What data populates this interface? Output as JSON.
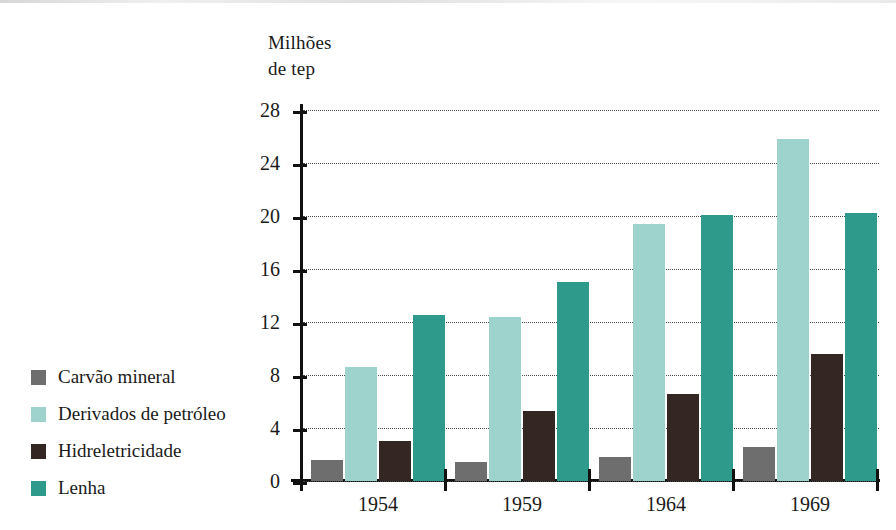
{
  "chart_data": {
    "type": "bar",
    "title": "",
    "axis_title": "Milhões\nde tep",
    "ylabel": "Milhões de tep",
    "xlabel": "",
    "categories": [
      "1954",
      "1959",
      "1964",
      "1969"
    ],
    "series": [
      {
        "name": "Carvão mineral",
        "color": "#6e6e6e",
        "values": [
          1.6,
          1.4,
          1.8,
          2.6
        ]
      },
      {
        "name": "Derivados de petróleo",
        "color": "#9ed2cd",
        "values": [
          8.6,
          12.4,
          19.4,
          25.8
        ]
      },
      {
        "name": "Hidreletricidade",
        "color": "#342622",
        "values": [
          3.0,
          5.3,
          6.6,
          9.6
        ]
      },
      {
        "name": "Lenha",
        "color": "#2e9a8c",
        "values": [
          12.5,
          15.0,
          20.1,
          20.2
        ]
      }
    ],
    "yticks": [
      0,
      4,
      8,
      12,
      16,
      20,
      24,
      28
    ],
    "ylim": [
      0,
      28
    ],
    "grid": true,
    "legend_position": "left-outside",
    "axis_color": "#111111",
    "gridline_color": "#4a4a4a",
    "background_color": "#ffffff"
  }
}
